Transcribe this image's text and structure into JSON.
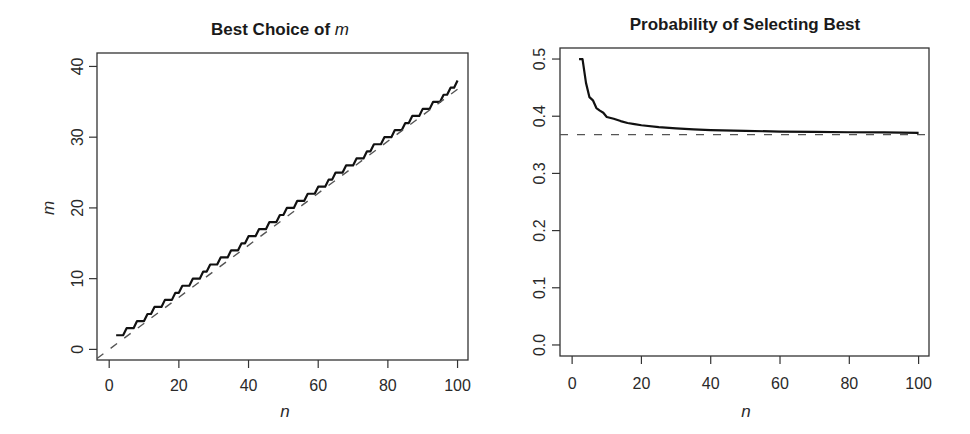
{
  "chart_data": [
    {
      "type": "line",
      "title": "Best Choice of m",
      "title_prefix": "Best Choice of ",
      "title_italic": "m",
      "xlabel": "n",
      "ylabel": "m",
      "xlim": [
        -3.5,
        103
      ],
      "ylim": [
        -1.5,
        41.9
      ],
      "xticks": [
        0,
        20,
        40,
        60,
        80,
        100
      ],
      "yticks": [
        0,
        10,
        20,
        30,
        40
      ],
      "grid": false,
      "legend": null,
      "series": [
        {
          "name": "optimal m",
          "style": "solid",
          "color": "#111111",
          "x": [
            2,
            3,
            4,
            5,
            6,
            7,
            8,
            9,
            10,
            11,
            12,
            13,
            14,
            15,
            16,
            17,
            18,
            19,
            20,
            21,
            22,
            23,
            24,
            25,
            26,
            27,
            28,
            29,
            30,
            31,
            32,
            33,
            34,
            35,
            36,
            37,
            38,
            39,
            40,
            41,
            42,
            43,
            44,
            45,
            46,
            47,
            48,
            49,
            50,
            51,
            52,
            53,
            54,
            55,
            56,
            57,
            58,
            59,
            60,
            61,
            62,
            63,
            64,
            65,
            66,
            67,
            68,
            69,
            70,
            71,
            72,
            73,
            74,
            75,
            76,
            77,
            78,
            79,
            80,
            81,
            82,
            83,
            84,
            85,
            86,
            87,
            88,
            89,
            90,
            91,
            92,
            93,
            94,
            95,
            96,
            97,
            98,
            99,
            100
          ],
          "y": [
            2,
            2,
            2,
            3,
            3,
            3,
            4,
            4,
            4,
            5,
            5,
            6,
            6,
            6,
            7,
            7,
            7,
            8,
            8,
            9,
            9,
            9,
            10,
            10,
            10,
            11,
            11,
            12,
            12,
            12,
            13,
            13,
            13,
            14,
            14,
            14,
            15,
            15,
            16,
            16,
            16,
            17,
            17,
            17,
            18,
            18,
            18,
            19,
            19,
            20,
            20,
            20,
            21,
            21,
            21,
            22,
            22,
            22,
            23,
            23,
            23,
            24,
            24,
            25,
            25,
            25,
            26,
            26,
            26,
            27,
            27,
            27,
            28,
            28,
            29,
            29,
            29,
            30,
            30,
            30,
            31,
            31,
            31,
            32,
            32,
            33,
            33,
            33,
            34,
            34,
            34,
            35,
            35,
            35,
            36,
            36,
            37,
            37,
            38
          ]
        },
        {
          "name": "n/e",
          "style": "dashed",
          "color": "#555555",
          "x": [
            -3.5,
            100
          ],
          "y": [
            -1.288,
            36.788
          ]
        }
      ]
    },
    {
      "type": "line",
      "title": "Probability of Selecting Best",
      "xlabel": "n",
      "ylabel": "",
      "xlim": [
        -3.5,
        103
      ],
      "ylim": [
        -0.0193,
        0.5193
      ],
      "xticks": [
        0,
        20,
        40,
        60,
        80,
        100
      ],
      "yticks": [
        0.0,
        0.1,
        0.2,
        0.3,
        0.4,
        0.5
      ],
      "ytick_labels": [
        "0.0",
        "0.1",
        "0.2",
        "0.3",
        "0.4",
        "0.5"
      ],
      "grid": false,
      "legend": null,
      "series": [
        {
          "name": "P(select best)",
          "style": "solid",
          "color": "#111111",
          "x": [
            2,
            3,
            4,
            5,
            6,
            7,
            8,
            9,
            10,
            12,
            14,
            16,
            18,
            20,
            25,
            30,
            35,
            40,
            50,
            60,
            70,
            80,
            90,
            100
          ],
          "y": [
            0.5,
            0.5,
            0.4583,
            0.4333,
            0.4278,
            0.4143,
            0.4098,
            0.406,
            0.3987,
            0.3955,
            0.3915,
            0.3881,
            0.3862,
            0.3842,
            0.3809,
            0.3787,
            0.377,
            0.3757,
            0.3743,
            0.3732,
            0.3726,
            0.372,
            0.3716,
            0.371
          ]
        },
        {
          "name": "1/e",
          "style": "dashed",
          "color": "#555555",
          "x": [
            -3.5,
            103
          ],
          "y": [
            0.3679,
            0.3679
          ]
        }
      ]
    }
  ]
}
